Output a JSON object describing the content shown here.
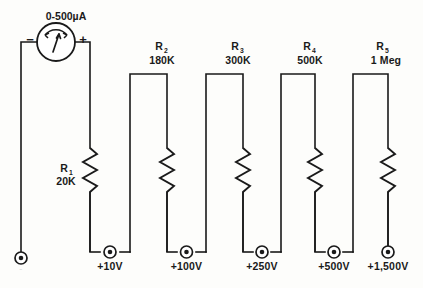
{
  "diagram": {
    "meter": {
      "range_label": "0-500µA",
      "negative_sign": "−",
      "positive_sign": "+",
      "name": "microammeter"
    },
    "resistors": [
      {
        "ref": "R",
        "sub": "1",
        "value": "20K"
      },
      {
        "ref": "R",
        "sub": "2",
        "value": "180K"
      },
      {
        "ref": "R",
        "sub": "3",
        "value": "300K"
      },
      {
        "ref": "R",
        "sub": "4",
        "value": "500K"
      },
      {
        "ref": "R",
        "sub": "5",
        "value": "1 Meg"
      }
    ],
    "terminals": [
      {
        "label": "+10V"
      },
      {
        "label": "+100V"
      },
      {
        "label": "+250V"
      },
      {
        "label": "+500V"
      },
      {
        "label": "+1,500V"
      }
    ],
    "ground_terminal": {
      "label": "−"
    },
    "colors": {
      "line": "#1a1a1a",
      "background": "#fdfdfb",
      "fill": "#ffffff"
    }
  }
}
